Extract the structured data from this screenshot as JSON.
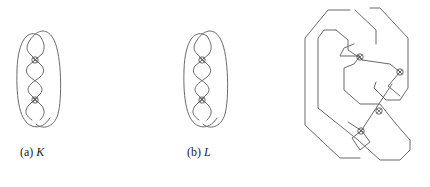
{
  "figure": {
    "panels": [
      {
        "id": "a",
        "label": "(a)",
        "symbol": "K",
        "virtual_crossings": 2
      },
      {
        "id": "b",
        "label": "(b)",
        "symbol": "L",
        "virtual_crossings": 2
      },
      {
        "id": "c",
        "label": "",
        "symbol": "",
        "virtual_crossings": 4,
        "caption_cropped": true
      }
    ]
  }
}
